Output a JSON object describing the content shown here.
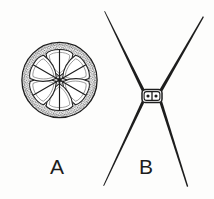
{
  "plate": {
    "background_color": "#fdfdfc",
    "ink_color": "#1d1d1d",
    "width": 214,
    "height": 199,
    "caption_font_size": 21
  },
  "figures": [
    {
      "id": "figure-a",
      "label": "A",
      "label_x": 50,
      "label_y": 156,
      "subject": "circular-diatom-valve",
      "description": "Circular valve in face view with six-petal rosette of smooth ribs set in a densely stippled (punctate) field",
      "geometry": {
        "type": "circle",
        "center_x": 59.5,
        "center_y": 80,
        "radius": 38,
        "outline_width": 1.2
      },
      "pattern": {
        "name": "stipple",
        "petal_count": 6,
        "petal_inner_radius": 5,
        "petal_outer_radius": 33,
        "rib_width": 1.1,
        "stipple_dot_radius": 0.62,
        "stipple_rows": 30,
        "stipple_color": "#2a2a2a"
      }
    },
    {
      "id": "figure-b",
      "label": "B",
      "label_x": 139,
      "label_y": 156,
      "subject": "x-shaped-cell-with-four-spines",
      "description": "Small rectangular central cell bearing four long tapering spines radiating outward in an X",
      "geometry": {
        "type": "x-cross",
        "center_x": 152,
        "center_y": 96,
        "cell_width": 20,
        "cell_height": 13,
        "cell_corner_radius": 3.5,
        "cell_inner_divisions": 2,
        "spine_count": 4,
        "spine_base_width": 3.2,
        "spine_tip_width": 0.4
      },
      "spine_endpoints": [
        {
          "name": "upper-left",
          "x": 104,
          "y": 11
        },
        {
          "name": "upper-right",
          "x": 203,
          "y": 16
        },
        {
          "name": "lower-left",
          "x": 103,
          "y": 186
        },
        {
          "name": "lower-right",
          "x": 187,
          "y": 187
        }
      ]
    }
  ],
  "labels": {
    "figure_a": "A",
    "figure_b": "B"
  }
}
